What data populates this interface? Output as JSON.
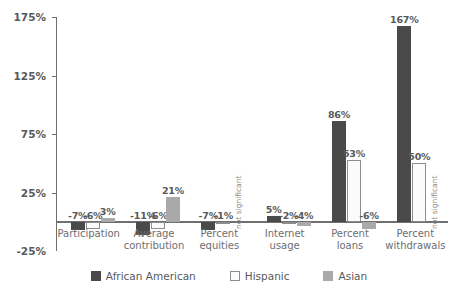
{
  "chart_data": {
    "type": "bar",
    "title": "",
    "subtitle": "",
    "xlabel": "",
    "ylabel": "",
    "ylim": [
      -25,
      175
    ],
    "yticks": [
      -25,
      25,
      75,
      125,
      175
    ],
    "ytick_labels": [
      "-25%",
      "25%",
      "75%",
      "125%",
      "175%"
    ],
    "grid": false,
    "legend_position": "bottom",
    "categories": [
      "Participation",
      "Average contribution",
      "Percent equities",
      "Internet usage",
      "Percent loans",
      "Percent withdrawals"
    ],
    "series": [
      {
        "name": "African American",
        "color": "#4a4a4a",
        "values": [
          -7,
          -11,
          -7,
          5,
          86,
          167
        ],
        "labels": [
          "-7%",
          "-11%",
          "-7%",
          "5%",
          "86%",
          "167%"
        ]
      },
      {
        "name": "Hispanic",
        "color": "#fbfbfb",
        "values": [
          -6,
          -6,
          -1,
          -2,
          53,
          50
        ],
        "labels": [
          "-6%",
          "-6%",
          "-1%",
          "-2%",
          "53%",
          "50%"
        ]
      },
      {
        "name": "Asian",
        "color": "#a9a9a9",
        "values": [
          3,
          21,
          null,
          -4,
          -6,
          null
        ],
        "labels": [
          "3%",
          "21%",
          "",
          "-4%",
          "-6%",
          ""
        ],
        "annotations": [
          null,
          null,
          "not significant",
          null,
          null,
          "not significant"
        ]
      }
    ]
  },
  "axis": {
    "tick_labels": [
      "175%",
      "125%",
      "75%",
      "25%",
      "-25%"
    ]
  },
  "categories_display": [
    "Participation",
    "Average\ncontribution",
    "Percent\nequities",
    "Internet\nusage",
    "Percent\nloans",
    "Percent\nwithdrawals"
  ],
  "legend": {
    "items": [
      {
        "label": "African American",
        "color": "#4a4a4a"
      },
      {
        "label": "Hispanic",
        "color": "#fbfbfb"
      },
      {
        "label": "Asian",
        "color": "#a9a9a9"
      }
    ]
  }
}
